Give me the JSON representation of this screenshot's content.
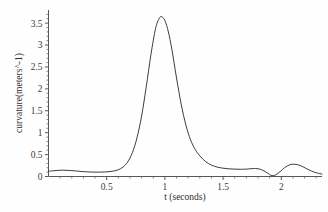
{
  "chart_data": {
    "type": "line",
    "title": "",
    "xlabel": "t (seconds)",
    "ylabel": "curvature(meters^-1)",
    "xlim": [
      0,
      2.35
    ],
    "ylim": [
      0,
      3.8
    ],
    "grid": false,
    "legend": null,
    "x_ticks": [
      0.5,
      1,
      1.5,
      2
    ],
    "x_tick_labels": [
      "0.5",
      "1",
      "1.5",
      "2"
    ],
    "x_minor_tick_step": 0.1,
    "y_ticks": [
      0,
      0.5,
      1,
      1.5,
      2,
      2.5,
      3,
      3.5
    ],
    "y_tick_labels": [
      "0",
      "0.5",
      "1",
      "1.5",
      "2",
      "2.5",
      "3",
      "3.5"
    ],
    "y_minor_tick_step": 0.1,
    "line_color": "#3c3c3c",
    "background_color": "#fefefe",
    "series": [
      {
        "name": "curvature",
        "x": [
          0.0,
          0.04,
          0.08,
          0.12,
          0.16,
          0.2,
          0.24,
          0.28,
          0.32,
          0.36,
          0.4,
          0.44,
          0.48,
          0.52,
          0.56,
          0.6,
          0.64,
          0.68,
          0.72,
          0.76,
          0.8,
          0.84,
          0.88,
          0.92,
          0.95,
          0.97,
          1.0,
          1.03,
          1.06,
          1.1,
          1.14,
          1.18,
          1.22,
          1.26,
          1.3,
          1.35,
          1.4,
          1.45,
          1.5,
          1.55,
          1.6,
          1.65,
          1.7,
          1.74,
          1.78,
          1.82,
          1.86,
          1.9,
          1.92,
          1.95,
          1.99,
          2.03,
          2.07,
          2.1,
          2.14,
          2.18,
          2.22,
          2.26,
          2.3,
          2.35
        ],
        "y": [
          0.12,
          0.13,
          0.14,
          0.145,
          0.14,
          0.135,
          0.125,
          0.115,
          0.108,
          0.102,
          0.1,
          0.1,
          0.103,
          0.11,
          0.125,
          0.155,
          0.215,
          0.33,
          0.54,
          0.88,
          1.38,
          2.05,
          2.78,
          3.38,
          3.6,
          3.65,
          3.56,
          3.3,
          2.9,
          2.25,
          1.65,
          1.18,
          0.84,
          0.62,
          0.47,
          0.34,
          0.26,
          0.215,
          0.19,
          0.175,
          0.168,
          0.165,
          0.168,
          0.178,
          0.182,
          0.165,
          0.115,
          0.045,
          0.02,
          0.035,
          0.11,
          0.205,
          0.265,
          0.28,
          0.27,
          0.23,
          0.175,
          0.125,
          0.085,
          0.055
        ]
      }
    ]
  },
  "axes": {
    "x_axis_title": "t (seconds)",
    "y_axis_title": "curvature(meters^-1)"
  }
}
